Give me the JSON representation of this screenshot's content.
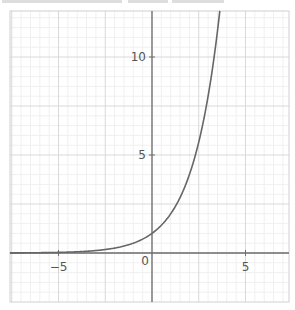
{
  "chart_data": {
    "type": "line",
    "title": "",
    "function": "y = 2^x",
    "xlabel": "",
    "ylabel": "",
    "xlim": [
      -7.6,
      7.3
    ],
    "ylim": [
      -2.5,
      12.35
    ],
    "grid": true,
    "major_grid_step": 2.5,
    "minor_grid_step": 0.5,
    "x_tick_labels": [
      "-5",
      "0",
      "5"
    ],
    "y_tick_labels": [
      "5",
      "10"
    ],
    "origin_label": "0",
    "series": [
      {
        "name": "y = 2^x",
        "color": "#666666",
        "x": [
          -7.6,
          -7,
          -6,
          -5,
          -4,
          -3,
          -2,
          -1,
          0,
          0.5,
          1,
          1.5,
          2,
          2.5,
          3,
          3.3,
          3.58
        ],
        "y": [
          0.005,
          0.008,
          0.016,
          0.031,
          0.063,
          0.125,
          0.25,
          0.5,
          1,
          1.414,
          2,
          2.828,
          4,
          5.657,
          8,
          9.85,
          11.96
        ]
      }
    ]
  },
  "labels": {
    "x_neg5": "−5",
    "x_0": "0",
    "x_5": "5",
    "y_5": "5",
    "y_10": "10"
  },
  "colors": {
    "curve": "#666666",
    "axis": "#6e6e6e",
    "major_grid": "#d9d9d9",
    "minor_grid": "#f0f0f0",
    "frame": "#d0d0d0"
  }
}
